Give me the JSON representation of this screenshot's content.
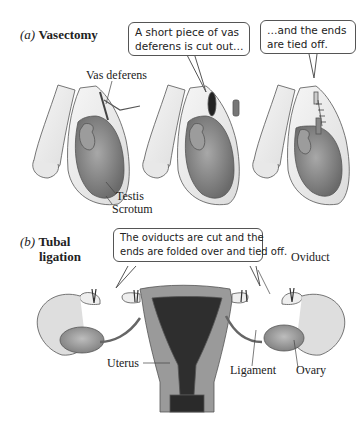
{
  "panel_a": {
    "letter": "(a)",
    "title": "Vasectomy",
    "callouts": [
      {
        "line1": "A short piece of vas",
        "line2": "deferens is cut out…"
      },
      {
        "line1": "…and the ends",
        "line2": "are tied off."
      }
    ],
    "labels": {
      "vas_deferens": "Vas deferens",
      "testis": "Testis",
      "scrotum": "Scrotum"
    }
  },
  "panel_b": {
    "letter": "(b)",
    "title_line1": "Tubal",
    "title_line2": "ligation",
    "callout": {
      "line1": "The oviducts are cut and the",
      "line2": "ends are folded over and tied off."
    },
    "labels": {
      "oviduct": "Oviduct",
      "uterus": "Uterus",
      "ligament": "Ligament",
      "ovary": "Ovary"
    }
  },
  "colors": {
    "outline": "#555555",
    "skin": "#eeeeee",
    "testis": "#8a8a8a",
    "uterus_wall": "#9a9a9a",
    "uterus_cavity": "#2e2e2e"
  }
}
